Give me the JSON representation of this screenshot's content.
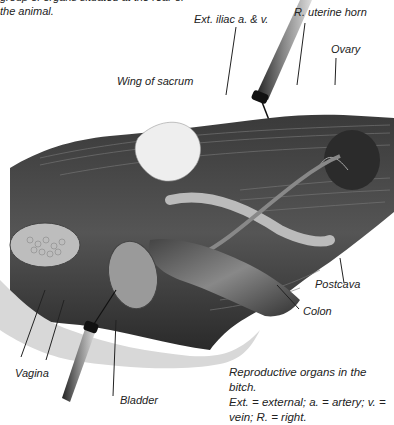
{
  "intro_text": {
    "line1": "group of organs situated at the rear of",
    "line2": "the animal."
  },
  "figure": {
    "labels": [
      {
        "id": "ext-iliac",
        "text": "Ext. iliac a. & v."
      },
      {
        "id": "r-uterine-horn",
        "text": "R. uterine horn"
      },
      {
        "id": "ovary",
        "text": "Ovary"
      },
      {
        "id": "wing-of-sacrum",
        "text": "Wing of sacrum"
      },
      {
        "id": "postcava",
        "text": "Postcava"
      },
      {
        "id": "colon",
        "text": "Colon"
      },
      {
        "id": "vagina",
        "text": "Vagina"
      },
      {
        "id": "bladder",
        "text": "Bladder"
      }
    ]
  },
  "caption": {
    "line1": "Reproductive organs in the bitch.",
    "line2": "Ext. = external; a. = artery; v. =",
    "line3": "vein; R. = right."
  }
}
